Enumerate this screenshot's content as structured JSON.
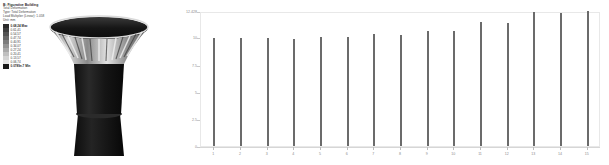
{
  "annotation": {
    "title": "B: Figurative Building",
    "lines": [
      "Total Deformation",
      "Type: Total Deformation",
      "Unit: mm",
      "Load Multiplier (Linear): 1.058",
      "Unit: mm"
    ]
  },
  "legend": {
    "max_label": "0.68,24 Max",
    "min_label": "0.0789e-7 Min",
    "bands": [
      {
        "label": "0.68,24 Max",
        "color": "#2a2a2a"
      },
      {
        "label": "0.61,41",
        "color": "#3d3d3d"
      },
      {
        "label": "0.54,57",
        "color": "#525252"
      },
      {
        "label": "0.47,74",
        "color": "#676767"
      },
      {
        "label": "0.40,91",
        "color": "#7d7d7d"
      },
      {
        "label": "0.34,07",
        "color": "#949494"
      },
      {
        "label": "0.27,24",
        "color": "#aaaaaa"
      },
      {
        "label": "0.20,41",
        "color": "#c0c0c0"
      },
      {
        "label": "0.13,57",
        "color": "#d4d4d4"
      },
      {
        "label": "0.06,74",
        "color": "#e6e6e6"
      },
      {
        "label": "0.0789e-7 Min",
        "color": "#1c1c1c"
      }
    ]
  },
  "model": {
    "name": "figurative-building-deformation-mesh",
    "description": "Grayscale contour-shaded 3D finite element model of a flared funnel-shaped tower on a tapered column base"
  },
  "chart_data": {
    "type": "bar",
    "title": "",
    "xlabel": "",
    "ylabel": "",
    "grid": false,
    "legend_position": "none",
    "categories": [
      1,
      2,
      3,
      4,
      5,
      6,
      7,
      8,
      9,
      10,
      11,
      12,
      13,
      14,
      15
    ],
    "values": [
      9.95,
      9.92,
      9.93,
      9.88,
      10.05,
      10.02,
      10.35,
      10.18,
      10.62,
      10.55,
      11.45,
      11.32,
      12.3,
      12.22,
      12.428
    ],
    "ytick_labels": [
      "12.428",
      "10",
      "7.5",
      "5",
      "2.5",
      "0"
    ],
    "ytick_values": [
      12.428,
      10,
      7.5,
      5,
      2.5,
      0
    ],
    "ylim": [
      0,
      12.428
    ],
    "xtick_labels": [
      "1",
      "2",
      "3",
      "4",
      "5",
      "6",
      "7",
      "8",
      "9",
      "10",
      "11",
      "12",
      "13",
      "14",
      "15"
    ],
    "bar_color": "#6b6b6b"
  }
}
